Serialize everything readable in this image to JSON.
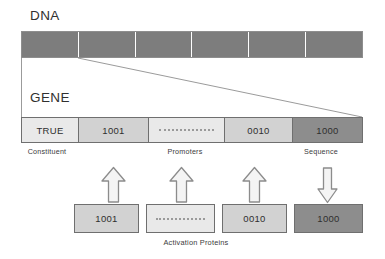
{
  "figure": {
    "dna": {
      "title": "DNA",
      "segment_count": 6,
      "segment_color": "#7d7d7d"
    },
    "gene": {
      "title": "GENE",
      "cells": [
        {
          "label": "TRUE",
          "fill": "#e9e9e9",
          "kind": "text"
        },
        {
          "label": "1001",
          "fill": "#d2d2d2",
          "kind": "text"
        },
        {
          "label": "",
          "fill": "#e9e9e9",
          "kind": "dotted"
        },
        {
          "label": "0010",
          "fill": "#d2d2d2",
          "kind": "text"
        },
        {
          "label": "1000",
          "fill": "#8d8d8d",
          "kind": "text"
        }
      ],
      "captions": {
        "constituent": "Constituent",
        "promoters": "Promoters",
        "sequence": "Sequence"
      }
    },
    "arrows": [
      {
        "direction": "up",
        "name": "activation-arrow-1"
      },
      {
        "direction": "up",
        "name": "activation-arrow-2"
      },
      {
        "direction": "up",
        "name": "activation-arrow-3"
      },
      {
        "direction": "down",
        "name": "sequence-output-arrow"
      }
    ],
    "proteins": {
      "caption": "Activation Proteins",
      "boxes": [
        {
          "label": "1001",
          "fill": "#d2d2d2",
          "kind": "text"
        },
        {
          "label": "",
          "fill": "#e9e9e9",
          "kind": "dotted"
        },
        {
          "label": "0010",
          "fill": "#d2d2d2",
          "kind": "text"
        },
        {
          "label": "1000",
          "fill": "#8d8d8d",
          "kind": "text"
        }
      ]
    },
    "colors": {
      "dna_segment": "#7d7d7d",
      "light_cell": "#e9e9e9",
      "mid_cell": "#d2d2d2",
      "dark_cell": "#8d8d8d",
      "outline": "#6f6f6f"
    }
  }
}
